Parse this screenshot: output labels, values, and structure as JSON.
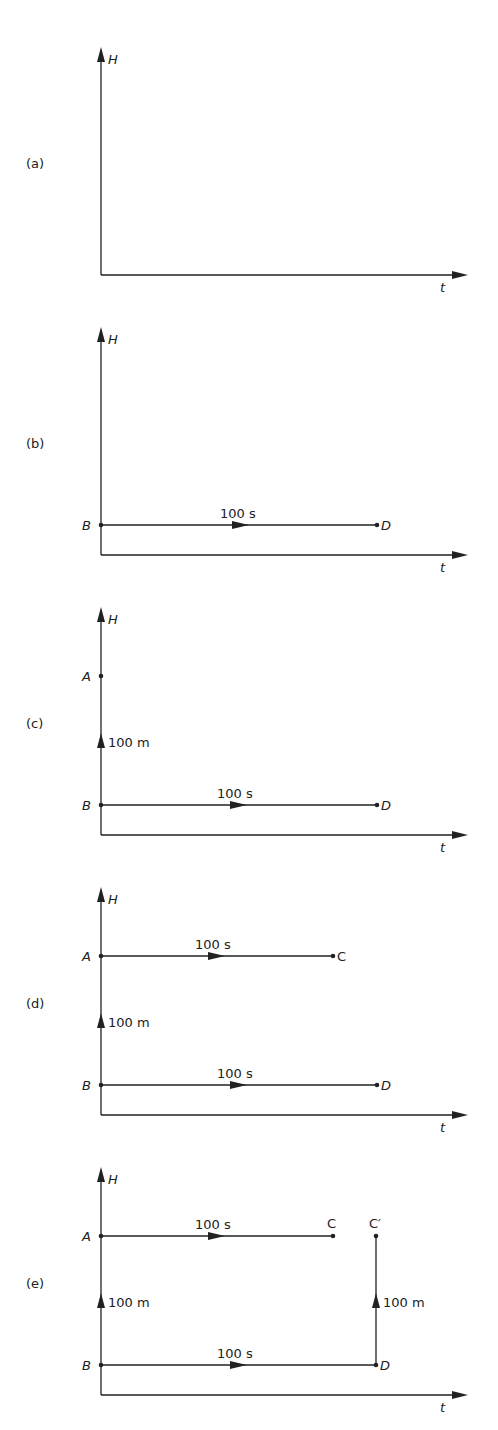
{
  "figure": {
    "axes": {
      "vertical_label": "H",
      "horizontal_label": "t"
    },
    "panels": [
      {
        "id": "a",
        "label": "(a)",
        "points": [],
        "segments": []
      },
      {
        "id": "b",
        "label": "(b)",
        "points": [
          {
            "name": "B"
          },
          {
            "name": "D"
          }
        ],
        "segments": [
          {
            "from": "B",
            "to": "D",
            "label": "100 s"
          }
        ]
      },
      {
        "id": "c",
        "label": "(c)",
        "points": [
          {
            "name": "A"
          },
          {
            "name": "B"
          },
          {
            "name": "D"
          }
        ],
        "segments": [
          {
            "from": "B",
            "to": "A",
            "label": "100 m"
          },
          {
            "from": "B",
            "to": "D",
            "label": "100 s"
          }
        ]
      },
      {
        "id": "d",
        "label": "(d)",
        "points": [
          {
            "name": "A"
          },
          {
            "name": "C"
          },
          {
            "name": "B"
          },
          {
            "name": "D"
          }
        ],
        "segments": [
          {
            "from": "A",
            "to": "C",
            "label": "100 s"
          },
          {
            "from": "B",
            "to": "A",
            "label": "100 m"
          },
          {
            "from": "B",
            "to": "D",
            "label": "100 s"
          }
        ]
      },
      {
        "id": "e",
        "label": "(e)",
        "points": [
          {
            "name": "A"
          },
          {
            "name": "C"
          },
          {
            "name": "C′"
          },
          {
            "name": "B"
          },
          {
            "name": "D"
          }
        ],
        "segments": [
          {
            "from": "A",
            "to": "C",
            "label": "100 s"
          },
          {
            "from": "B",
            "to": "A",
            "label": "100 m"
          },
          {
            "from": "B",
            "to": "D",
            "label": "100 s"
          },
          {
            "from": "D",
            "to": "C′",
            "label": "100 m"
          }
        ]
      }
    ]
  },
  "labels": {
    "a": "(a)",
    "b": "(b)",
    "c": "(c)",
    "d": "(d)",
    "e": "(e)",
    "H": "H",
    "t": "t",
    "A": "A",
    "B": "B",
    "C": "C",
    "Cp": "C′",
    "D": "D",
    "time": "100 s",
    "height": "100 m"
  }
}
